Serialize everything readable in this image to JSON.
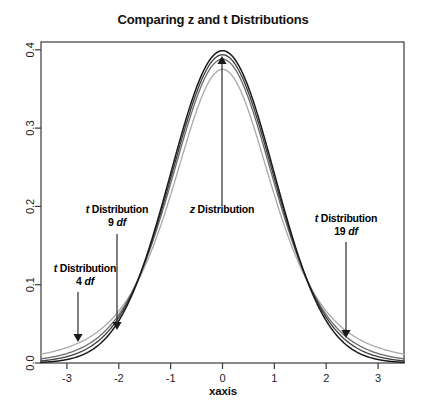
{
  "figure": {
    "title": "Comparing z and t Distributions",
    "background_color": "#ffffff",
    "frame_color": "#3a3a3a"
  },
  "axes": {
    "x": {
      "label": "xaxis",
      "ticks": [
        "-3",
        "-2",
        "-1",
        "0",
        "1",
        "2",
        "3"
      ],
      "tick_values": [
        -3,
        -2,
        -1,
        0,
        1,
        2,
        3
      ],
      "range": [
        -3.5,
        3.5
      ]
    },
    "y": {
      "label": "",
      "ticks": [
        "0.0",
        "0.1",
        "0.2",
        "0.3",
        "0.4"
      ],
      "tick_values": [
        0.0,
        0.1,
        0.2,
        0.3,
        0.4
      ],
      "range": [
        0.0,
        0.4
      ]
    }
  },
  "annotations": [
    {
      "name": "z-distribution-annotation",
      "text_prefix": "z",
      "text_rest": " Distribution",
      "line1": "z Distribution",
      "line2": "",
      "label_x": 222,
      "label_y": 213,
      "arrow_from_x": 222,
      "arrow_from_y": 205,
      "arrow_to_x": 222,
      "arrow_to_y": 56,
      "direction": "up"
    },
    {
      "name": "t-distribution-4df-annotation",
      "text_prefix": "t",
      "text_rest": " Distribution",
      "df": "4",
      "df_unit": "df",
      "line1": "t Distribution",
      "line2": "4 df",
      "label_x": 85,
      "label_y": 272,
      "arrow_from_x": 78,
      "arrow_from_y": 292,
      "arrow_to_x": 78,
      "arrow_to_y": 342,
      "direction": "down"
    },
    {
      "name": "t-distribution-9df-annotation",
      "text_prefix": "t",
      "text_rest": " Distribution",
      "df": "9",
      "df_unit": "df",
      "line1": "t Distribution",
      "line2": "9 df",
      "label_x": 117,
      "label_y": 213,
      "arrow_from_x": 117,
      "arrow_from_y": 234,
      "arrow_to_x": 117,
      "arrow_to_y": 330,
      "direction": "down"
    },
    {
      "name": "t-distribution-19df-annotation",
      "text_prefix": "t",
      "text_rest": " Distribution",
      "df": "19",
      "df_unit": "df",
      "line1": "t Distribution",
      "line2": "19 df",
      "label_x": 346,
      "label_y": 222,
      "arrow_from_x": 346,
      "arrow_from_y": 242,
      "arrow_to_x": 346,
      "arrow_to_y": 338,
      "direction": "down"
    }
  ],
  "chart_data": {
    "type": "line",
    "title": "Comparing z and t Distributions",
    "xlabel": "xaxis",
    "ylabel": "",
    "xlim": [
      -3.5,
      3.5
    ],
    "ylim": [
      0.0,
      0.4
    ],
    "grid": false,
    "legend": "none",
    "legend_position": "annotations-inline",
    "x": [
      -3.5,
      -3.25,
      -3,
      -2.75,
      -2.5,
      -2.25,
      -2,
      -1.75,
      -1.5,
      -1.25,
      -1,
      -0.75,
      -0.5,
      -0.25,
      0,
      0.25,
      0.5,
      0.75,
      1,
      1.25,
      1.5,
      1.75,
      2,
      2.25,
      2.5,
      2.75,
      3,
      3.25,
      3.5
    ],
    "series": [
      {
        "name": "z Distribution",
        "kind": "normal",
        "df": null,
        "color": "#1a1a1a",
        "width": 1.5,
        "peak": 0.3989,
        "values": [
          0.0009,
          0.002,
          0.0044,
          0.0091,
          0.0175,
          0.0317,
          0.054,
          0.0863,
          0.1295,
          0.1826,
          0.242,
          0.3011,
          0.3521,
          0.3867,
          0.3989,
          0.3867,
          0.3521,
          0.3011,
          0.242,
          0.1826,
          0.1295,
          0.0863,
          0.054,
          0.0317,
          0.0175,
          0.0091,
          0.0044,
          0.002,
          0.0009
        ]
      },
      {
        "name": "t Distribution 19 df",
        "kind": "student-t",
        "df": 19,
        "color": "#3d3d3d",
        "width": 1.3,
        "peak": 0.3917,
        "values": [
          0.0019,
          0.0035,
          0.0064,
          0.0115,
          0.0199,
          0.0335,
          0.0546,
          0.0851,
          0.1263,
          0.1779,
          0.2369,
          0.2966,
          0.3487,
          0.3845,
          0.3917,
          0.3845,
          0.3487,
          0.2966,
          0.2369,
          0.1779,
          0.1263,
          0.0851,
          0.0546,
          0.0335,
          0.0199,
          0.0115,
          0.0064,
          0.0035,
          0.0019
        ]
      },
      {
        "name": "t Distribution 9 df",
        "kind": "student-t",
        "df": 9,
        "color": "#6b6b6b",
        "width": 1.3,
        "peak": 0.3801,
        "values": [
          0.0036,
          0.006,
          0.0098,
          0.0159,
          0.0252,
          0.039,
          0.0587,
          0.086,
          0.1219,
          0.1668,
          0.2194,
          0.2756,
          0.3278,
          0.3663,
          0.3801,
          0.3663,
          0.3278,
          0.2756,
          0.2194,
          0.1668,
          0.1219,
          0.086,
          0.0587,
          0.039,
          0.0252,
          0.0159,
          0.0098,
          0.006,
          0.0036
        ]
      },
      {
        "name": "t Distribution 4 df",
        "kind": "student-t",
        "df": 4,
        "color": "#a9a9a9",
        "width": 1.3,
        "peak": 0.375,
        "values": [
          0.0086,
          0.0125,
          0.0183,
          0.0268,
          0.0386,
          0.0546,
          0.0755,
          0.1017,
          0.133,
          0.1684,
          0.2067,
          0.2457,
          0.2827,
          0.3137,
          0.375,
          0.3137,
          0.2827,
          0.2457,
          0.2067,
          0.1684,
          0.133,
          0.1017,
          0.0755,
          0.0546,
          0.0386,
          0.0268,
          0.0183,
          0.0125,
          0.0086
        ]
      }
    ]
  }
}
